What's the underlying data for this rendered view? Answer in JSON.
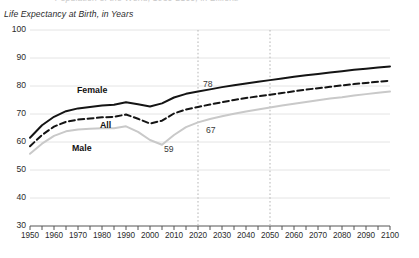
{
  "clipped_title": "Population of the World, 1950-2100, in Billions",
  "axis_title": "Life Expectancy at Birth, in Years",
  "chart_data": {
    "type": "line",
    "title": "Life Expectancy at Birth, in Years",
    "xlabel": "",
    "ylabel": "Life Expectancy at Birth, in Years",
    "xlim": [
      1950,
      2100
    ],
    "ylim": [
      30,
      100
    ],
    "ytick_step": 10,
    "xtick_step": 5,
    "xlabel_step": 10,
    "grid": true,
    "legend_position": "inline-annotations",
    "yticks": [
      "100",
      "90",
      "80",
      "70",
      "60",
      "50",
      "40",
      "30"
    ],
    "xticks": [
      "1950",
      "1960",
      "1970",
      "1980",
      "1990",
      "2000",
      "2010",
      "2020",
      "2030",
      "2040",
      "2050",
      "2060",
      "2070",
      "2080",
      "2090",
      "2100"
    ],
    "reference_lines": [
      {
        "x": 2020,
        "style": "dotted",
        "color": "#b5b5b5"
      },
      {
        "x": 2050,
        "style": "dotted",
        "color": "#b5b5b5"
      }
    ],
    "x": [
      1950,
      1955,
      1960,
      1965,
      1970,
      1975,
      1980,
      1985,
      1990,
      1995,
      2000,
      2005,
      2010,
      2015,
      2020,
      2025,
      2030,
      2035,
      2040,
      2045,
      2050,
      2055,
      2060,
      2065,
      2070,
      2075,
      2080,
      2085,
      2090,
      2095,
      2100
    ],
    "series": [
      {
        "name": "Female",
        "color": "#141414",
        "style": "solid",
        "width": 2.0,
        "values": [
          61.5,
          66.0,
          69.0,
          71.0,
          72.0,
          72.5,
          73.0,
          73.3,
          74.2,
          73.5,
          72.7,
          73.8,
          75.9,
          77.2,
          78.0,
          78.8,
          79.6,
          80.3,
          80.9,
          81.5,
          82.1,
          82.7,
          83.3,
          83.8,
          84.3,
          84.8,
          85.3,
          85.8,
          86.2,
          86.6,
          87.0
        ]
      },
      {
        "name": "All",
        "color": "#141414",
        "style": "dashed",
        "width": 2.0,
        "values": [
          58.5,
          62.5,
          65.5,
          67.2,
          68.0,
          68.4,
          68.8,
          69.0,
          69.8,
          68.3,
          66.6,
          67.6,
          70.2,
          71.6,
          72.5,
          73.4,
          74.2,
          75.0,
          75.7,
          76.3,
          76.9,
          77.5,
          78.1,
          78.7,
          79.2,
          79.7,
          80.2,
          80.7,
          81.1,
          81.5,
          81.9
        ]
      },
      {
        "name": "Male",
        "color": "#c9c9c9",
        "style": "solid",
        "width": 2.0,
        "values": [
          55.8,
          59.4,
          62.2,
          63.8,
          64.5,
          64.7,
          64.9,
          64.9,
          65.6,
          63.6,
          60.7,
          59.0,
          62.5,
          65.3,
          67.0,
          68.2,
          69.2,
          70.1,
          70.9,
          71.6,
          72.3,
          73.0,
          73.7,
          74.3,
          74.9,
          75.5,
          76.0,
          76.6,
          77.1,
          77.6,
          78.0
        ]
      }
    ],
    "series_labels": [
      {
        "text": "Female",
        "x_px": 77,
        "y_px": 85
      },
      {
        "text": "All",
        "x_px": 100,
        "y_px": 120
      },
      {
        "text": "Male",
        "x_px": 72,
        "y_px": 143
      },
      {
        "text": "59",
        "x_px": 164,
        "y_px": 144
      },
      {
        "text": "67",
        "x_px": 206,
        "y_px": 125
      },
      {
        "text": "78",
        "x_px": 203,
        "y_px": 79
      }
    ],
    "annotations": [
      {
        "label": "78",
        "series": "Female",
        "x": 2020,
        "value": 78
      },
      {
        "label": "67",
        "series": "Male",
        "x": 2020,
        "value": 67
      },
      {
        "label": "59",
        "series": "Male",
        "x": 2005,
        "value": 59
      }
    ]
  }
}
